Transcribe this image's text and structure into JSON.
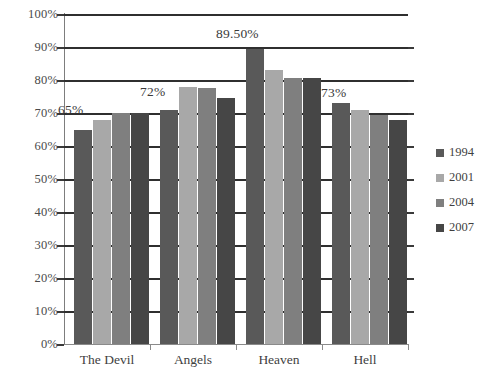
{
  "chart_data": {
    "type": "bar",
    "title": "",
    "xlabel": "",
    "ylabel": "",
    "ylim": [
      0,
      100
    ],
    "grid": true,
    "legend_position": "right",
    "categories": [
      "The Devil",
      "Angels",
      "Heaven",
      "Hell"
    ],
    "tick_labels": [
      "0%",
      "10%",
      "20%",
      "30%",
      "40%",
      "50%",
      "60%",
      "70%",
      "80%",
      "90%",
      "100%"
    ],
    "tick_values": [
      0,
      10,
      20,
      30,
      40,
      50,
      60,
      70,
      80,
      90,
      100
    ],
    "series": [
      {
        "name": "1994",
        "color": "#595959",
        "values": [
          65.0,
          71.0,
          89.5,
          73.0
        ]
      },
      {
        "name": "2001",
        "color": "#a8a8a8",
        "values": [
          68.0,
          78.0,
          83.0,
          71.0
        ]
      },
      {
        "name": "2004",
        "color": "#7f7f7f",
        "values": [
          70.0,
          77.5,
          80.5,
          69.5
        ]
      },
      {
        "name": "2007",
        "color": "#464646",
        "values": [
          70.0,
          74.5,
          80.5,
          68.0
        ]
      }
    ],
    "annotations": [
      {
        "text": "65%",
        "category": "The Devil"
      },
      {
        "text": "72%",
        "category": "Angels"
      },
      {
        "text": "89.50%",
        "category": "Heaven"
      },
      {
        "text": "73%",
        "category": "Hell"
      }
    ]
  },
  "axis": {
    "y": {
      "labels": [
        "100%",
        "90%",
        "80%",
        "70%",
        "60%",
        "50%",
        "40%",
        "30%",
        "20%",
        "10%",
        "0%"
      ]
    },
    "x": {
      "labels": [
        "The Devil",
        "Angels",
        "Heaven",
        "Hell"
      ]
    }
  },
  "legend": {
    "items": [
      {
        "label": "1994",
        "color": "#595959"
      },
      {
        "label": "2001",
        "color": "#a8a8a8"
      },
      {
        "label": "2004",
        "color": "#7f7f7f"
      },
      {
        "label": "2007",
        "color": "#464646"
      }
    ]
  },
  "labels": {
    "devil": "65%",
    "angels": "72%",
    "heaven": "89.50%",
    "hell": "73%"
  },
  "title_remnant": ""
}
